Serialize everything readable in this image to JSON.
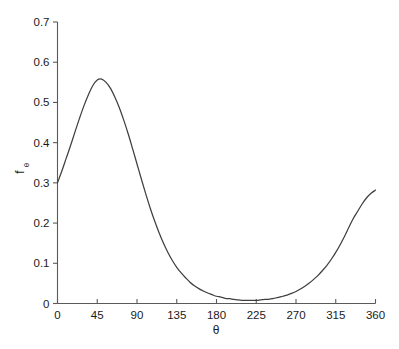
{
  "chart_data": {
    "type": "line",
    "title": "",
    "xlabel": "θ",
    "ylabel": "f",
    "ylabel_subscript": "θ",
    "xlim": [
      0,
      360
    ],
    "ylim": [
      0,
      0.7
    ],
    "grid": false,
    "legend": null,
    "xticks": [
      0,
      45,
      90,
      135,
      180,
      225,
      270,
      315,
      360
    ],
    "xtick_labels": [
      "0",
      "45",
      "90",
      "135",
      "180",
      "225",
      "270",
      "315",
      "360"
    ],
    "yticks": [
      0,
      0.1,
      0.2,
      0.3,
      0.4,
      0.5,
      0.6,
      0.7
    ],
    "ytick_labels": [
      "0",
      "0.1",
      "0.2",
      "0.3",
      "0.4",
      "0.5",
      "0.6",
      "0.7"
    ],
    "series": [
      {
        "name": "fθ",
        "color": "#3f3f3f",
        "x": [
          0,
          5,
          10,
          15,
          20,
          25,
          30,
          35,
          40,
          45,
          50,
          55,
          60,
          65,
          70,
          75,
          80,
          85,
          90,
          95,
          100,
          105,
          110,
          115,
          120,
          125,
          130,
          135,
          140,
          145,
          150,
          155,
          160,
          165,
          170,
          175,
          180,
          185,
          190,
          195,
          200,
          205,
          210,
          215,
          220,
          225,
          230,
          235,
          240,
          245,
          250,
          255,
          260,
          265,
          270,
          275,
          280,
          285,
          290,
          295,
          300,
          305,
          310,
          315,
          320,
          325,
          330,
          335,
          340,
          345,
          350,
          355,
          360
        ],
        "y": [
          0.3,
          0.33,
          0.362,
          0.394,
          0.428,
          0.461,
          0.492,
          0.519,
          0.542,
          0.556,
          0.558,
          0.55,
          0.535,
          0.513,
          0.487,
          0.456,
          0.422,
          0.385,
          0.347,
          0.309,
          0.272,
          0.237,
          0.205,
          0.176,
          0.15,
          0.127,
          0.107,
          0.09,
          0.076,
          0.064,
          0.053,
          0.044,
          0.037,
          0.031,
          0.026,
          0.022,
          0.018,
          0.016,
          0.013,
          0.012,
          0.01,
          0.009,
          0.008,
          0.008,
          0.008,
          0.008,
          0.009,
          0.01,
          0.011,
          0.013,
          0.015,
          0.018,
          0.021,
          0.025,
          0.03,
          0.036,
          0.043,
          0.051,
          0.06,
          0.07,
          0.082,
          0.095,
          0.11,
          0.127,
          0.146,
          0.167,
          0.19,
          0.212,
          0.23,
          0.248,
          0.263,
          0.274,
          0.282
        ]
      }
    ],
    "annotations": {
      "peak_x": 45,
      "peak_y": 0.558,
      "start_y": 0.3,
      "min_x": 215,
      "min_y": 0.008,
      "end_y": 0.282
    }
  }
}
